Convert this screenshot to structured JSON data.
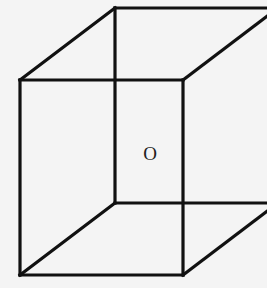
{
  "diagram": {
    "colors": {
      "background": "#f4f4f4",
      "stroke": "#111111",
      "label": "#222222"
    },
    "vertices": {
      "front_top_left": [
        20,
        80
      ],
      "front_top_right": [
        183,
        80
      ],
      "front_bottom_left": [
        20,
        275
      ],
      "front_bottom_right": [
        183,
        275
      ],
      "back_top_left": [
        115,
        8
      ],
      "back_top_right": [
        278,
        8
      ],
      "back_bottom_left": [
        115,
        203
      ],
      "back_bottom_right": [
        278,
        203
      ]
    },
    "labels": [
      {
        "id": "center",
        "text": "O",
        "x": 150,
        "y": 160
      }
    ]
  }
}
